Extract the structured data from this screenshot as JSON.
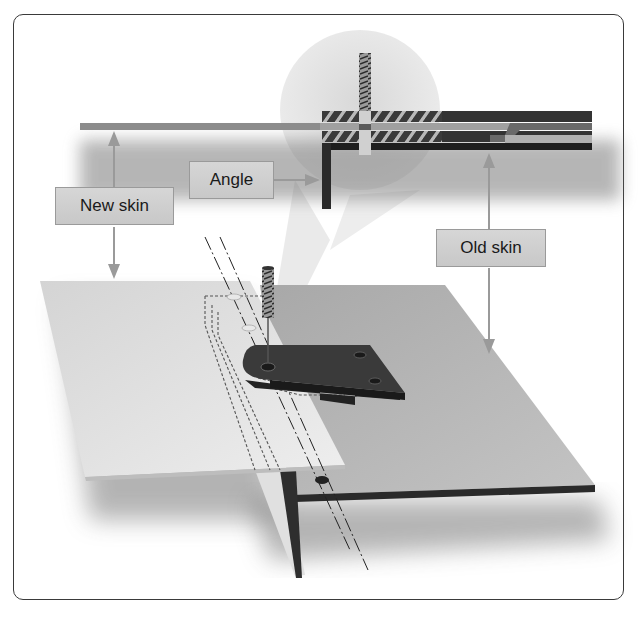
{
  "diagram": {
    "labels": {
      "new_skin": "New skin",
      "angle": "Angle",
      "old_skin": "Old skin"
    },
    "colors": {
      "frame_border": "#3a3a3a",
      "label_fill": "#cfcfcf",
      "label_border": "#9a9a9a",
      "arrow": "#9a9a9a",
      "new_skin_plate": "#dcdcdc",
      "old_skin_plate": "#b8b8b8",
      "angle_dark": "#2e2e2e",
      "magnifier_circle": "#e6e6e6"
    },
    "components": [
      "new-skin-plate",
      "old-skin-plate",
      "angle-bracket",
      "drill-bit",
      "magnified-cross-section",
      "dashed-hidden-lines",
      "centerlines",
      "rivet-holes"
    ]
  }
}
